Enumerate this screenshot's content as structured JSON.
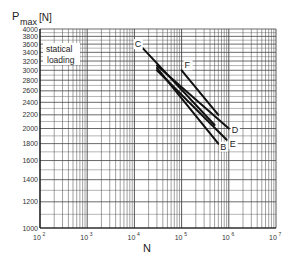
{
  "chart_data": {
    "type": "line",
    "title": "",
    "xlabel": "N",
    "ylabel": "P max [N]",
    "ylabel_main": "P",
    "ylabel_sub": "max",
    "ylabel_unit": "[N]",
    "xscale": "log",
    "yscale": "log",
    "xlim": [
      100,
      10000000
    ],
    "ylim": [
      1000,
      4000
    ],
    "x_ticks": [
      "10^2",
      "10^3",
      "10^4",
      "10^5",
      "10^6",
      "10^7"
    ],
    "y_ticks": [
      1000,
      1200,
      1400,
      1600,
      1800,
      2000,
      2200,
      2400,
      2600,
      2800,
      3000,
      3200,
      3400,
      3600,
      3800,
      4000
    ],
    "annotation": "statical loading",
    "annotation_lines": [
      "statical",
      "loading"
    ],
    "grid": true,
    "series": [
      {
        "name": "B",
        "points": [
          [
            30000,
            3050
          ],
          [
            600000,
            1800
          ]
        ]
      },
      {
        "name": "C",
        "points": [
          [
            15000,
            3500
          ],
          [
            500000,
            2050
          ]
        ]
      },
      {
        "name": "D",
        "points": [
          [
            30000,
            3100
          ],
          [
            1000000,
            2000
          ]
        ]
      },
      {
        "name": "E",
        "points": [
          [
            30000,
            3000
          ],
          [
            900000,
            1850
          ]
        ]
      },
      {
        "name": "F",
        "points": [
          [
            100000,
            3000
          ],
          [
            600000,
            2200
          ]
        ]
      }
    ]
  }
}
